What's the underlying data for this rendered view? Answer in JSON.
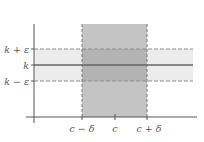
{
  "diagram": {
    "type": "epsilon-delta limit illustration",
    "y_labels": {
      "upper": "k + ε",
      "middle": "k",
      "lower": "k − ε"
    },
    "x_labels": {
      "left": "c − δ",
      "center": "c",
      "right": "c + δ"
    },
    "colors": {
      "background": "#ffffff",
      "delta_band": "#bdbdbd",
      "epsilon_band": "#ececec",
      "overlap": "#b0b0b0",
      "axis": "#555555",
      "k_line": "#666666",
      "dashed": "#8c8c8c",
      "label": "#555555"
    }
  }
}
